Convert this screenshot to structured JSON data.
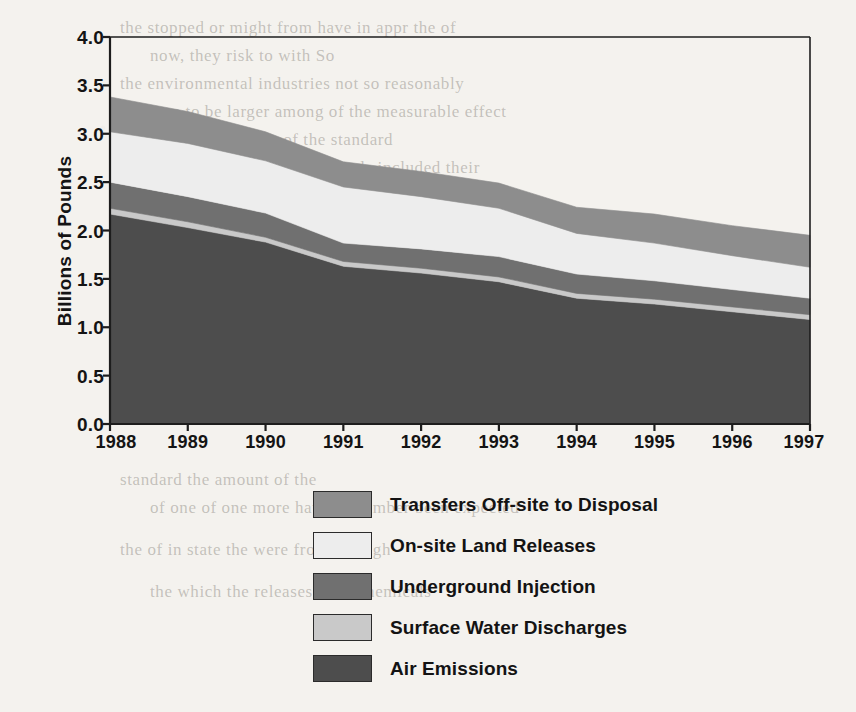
{
  "chart_data": {
    "type": "area",
    "stacked": true,
    "title": "",
    "subtitle": "",
    "xlabel": "",
    "ylabel": "Billions of Pounds",
    "categories": [
      1988,
      1989,
      1990,
      1991,
      1992,
      1993,
      1994,
      1995,
      1996,
      1997
    ],
    "x_tick_labels": [
      "1988",
      "1989",
      "1990",
      "1991",
      "1992",
      "1993",
      "1994",
      "1995",
      "1996",
      "1997"
    ],
    "y_tick_labels": [
      "0.0",
      "0.5",
      "1.0",
      "1.5",
      "2.0",
      "2.5",
      "3.0",
      "3.5",
      "4.0"
    ],
    "y_tick_values": [
      0.0,
      0.5,
      1.0,
      1.5,
      2.0,
      2.5,
      3.0,
      3.5,
      4.0
    ],
    "ylim": [
      0.0,
      4.0
    ],
    "xlim": [
      1988,
      1997
    ],
    "grid": false,
    "legend_position": "below-center",
    "stack_order_bottom_to_top": [
      "Air Emissions",
      "Surface Water Discharges",
      "Underground Injection",
      "On-site Land Releases",
      "Transfers Off-site to Disposal"
    ],
    "series": [
      {
        "name": "Air Emissions",
        "color": "#4d4d4d",
        "values": [
          2.17,
          2.03,
          1.88,
          1.63,
          1.56,
          1.47,
          1.3,
          1.24,
          1.16,
          1.08
        ]
      },
      {
        "name": "Surface Water Discharges",
        "color": "#c9c9c9",
        "values": [
          0.06,
          0.06,
          0.05,
          0.05,
          0.05,
          0.05,
          0.05,
          0.05,
          0.05,
          0.05
        ]
      },
      {
        "name": "Underground Injection",
        "color": "#707070",
        "values": [
          0.27,
          0.26,
          0.25,
          0.19,
          0.2,
          0.21,
          0.2,
          0.19,
          0.18,
          0.17
        ]
      },
      {
        "name": "On-site Land Releases",
        "color": "#ededed",
        "values": [
          0.52,
          0.55,
          0.54,
          0.58,
          0.54,
          0.5,
          0.42,
          0.39,
          0.35,
          0.32
        ]
      },
      {
        "name": "Transfers Off-site to Disposal",
        "color": "#8d8d8d",
        "values": [
          0.36,
          0.33,
          0.3,
          0.26,
          0.26,
          0.26,
          0.27,
          0.3,
          0.31,
          0.33
        ]
      }
    ],
    "cumulative_tops": {
      "Air Emissions": [
        2.17,
        2.03,
        1.88,
        1.63,
        1.56,
        1.47,
        1.3,
        1.24,
        1.16,
        1.08
      ],
      "Surface Water Discharges": [
        2.23,
        2.09,
        1.93,
        1.68,
        1.61,
        1.52,
        1.35,
        1.29,
        1.21,
        1.13
      ],
      "Underground Injection": [
        2.5,
        2.35,
        2.18,
        1.87,
        1.81,
        1.73,
        1.55,
        1.48,
        1.39,
        1.3
      ],
      "On-site Land Releases": [
        3.02,
        2.9,
        2.72,
        2.45,
        2.35,
        2.23,
        1.97,
        1.87,
        1.74,
        1.62
      ],
      "Transfers Off-site to Disposal": [
        3.38,
        3.23,
        3.02,
        2.71,
        2.61,
        2.49,
        2.24,
        2.17,
        2.05,
        1.95
      ]
    },
    "totals": [
      3.38,
      3.23,
      3.02,
      2.71,
      2.61,
      2.49,
      2.24,
      2.17,
      2.05,
      1.95
    ]
  },
  "axis": {
    "y_title": "Billions of Pounds"
  },
  "legend": {
    "items": [
      {
        "label": "Transfers Off-site to Disposal",
        "color": "#8d8d8d"
      },
      {
        "label": "On-site Land Releases",
        "color": "#ededed"
      },
      {
        "label": "Underground Injection",
        "color": "#707070"
      },
      {
        "label": "Surface Water Discharges",
        "color": "#c9c9c9"
      },
      {
        "label": "Air Emissions",
        "color": "#4d4d4d"
      }
    ]
  },
  "background_text": {
    "lines": [
      "the stopped or might from have in appr the of",
      "now, they risk   to with So",
      "the environmental industries not so reasonably",
      "sure to be larger among  of the measurable effect",
      "billion  to 2.24 billion of the standard",
      "or the 2000 was the chemicals included  their",
      "of a manufacturing from the state  and",
      "more the amount reported for waste  the",
      "in   one for the  releases   the",
      "reduction the of the   waste and",
      "sites is     results with",
      "standard for commonly  chemicals releases and  emissions",
      "measurements with the  to 1997 in  reported   were",
      "The   industries   in the   1997  that the   remained",
      "standard   the    amount of the",
      "of one of one more  have  of  number  been expected",
      "the  of   in state  the  were   from   through",
      "the  which  the    releases   from  chemicals"
    ]
  }
}
